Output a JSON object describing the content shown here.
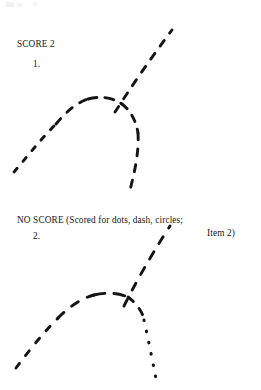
{
  "page": {
    "width": 261,
    "height": 390,
    "background_color": "#ffffff",
    "ink_color": "#141414"
  },
  "specimens": [
    {
      "id": "specimen-1",
      "verdict": "SCORE 2",
      "item_number": "1.",
      "item_reference": "",
      "description": "Hand-drawn arch with two tails, rendered entirely in short dashes.",
      "segments": [
        {
          "name": "lower-left-tail",
          "style": "dash",
          "stroke_pattern": "5 9",
          "path": "M 14 172 C 26 158, 40 140, 56 124"
        },
        {
          "name": "arch-left-rise",
          "style": "dash",
          "stroke_pattern": "7 9",
          "path": "M 56 124 C 66 112, 76 103, 88 99"
        },
        {
          "name": "arch-apex",
          "style": "dash",
          "stroke_pattern": "9 8",
          "path": "M 88 99 C 100 96, 112 97, 122 104"
        },
        {
          "name": "arch-right-fall",
          "style": "dash",
          "stroke_pattern": "7 8",
          "path": "M 122 104 C 131 111, 136 121, 138 133"
        },
        {
          "name": "right-descending-tail",
          "style": "dash",
          "stroke_pattern": "7 9",
          "path": "M 138 133 C 139 149, 136 167, 130 190"
        },
        {
          "name": "upper-diagonal",
          "style": "dash",
          "stroke_pattern": "7 9",
          "path": "M 115 112 C 128 92, 145 66, 172 30"
        }
      ]
    },
    {
      "id": "specimen-2",
      "verdict": "NO SCORE (Scored for dots, dash, circles;",
      "item_number": "2.",
      "item_reference": "Item 2)",
      "description": "Same arch form, but the right descending tail is rendered in dots rather than dashes.",
      "segments": [
        {
          "name": "lower-left-tail",
          "style": "dash",
          "stroke_pattern": "6 10",
          "path": "M 16 172 C 28 156, 42 138, 58 122"
        },
        {
          "name": "arch-left-rise",
          "style": "dash",
          "stroke_pattern": "8 10",
          "path": "M 58 122 C 70 110, 82 102, 94 99"
        },
        {
          "name": "arch-apex",
          "style": "dash",
          "stroke_pattern": "11 9",
          "path": "M 94 99 C 106 96, 118 97, 128 101"
        },
        {
          "name": "arch-right-fall",
          "style": "dash",
          "stroke_pattern": "7 9",
          "path": "M 128 101 C 136 107, 141 114, 144 122"
        },
        {
          "name": "right-descending-tail-dots",
          "style": "dot",
          "stroke_pattern": "0.5 11",
          "path": "M 144 124 C 148 142, 152 162, 157 188"
        },
        {
          "name": "upper-diagonal",
          "style": "dash",
          "stroke_pattern": "8 10",
          "path": "M 124 110 C 134 90, 148 64, 170 30"
        }
      ]
    }
  ]
}
